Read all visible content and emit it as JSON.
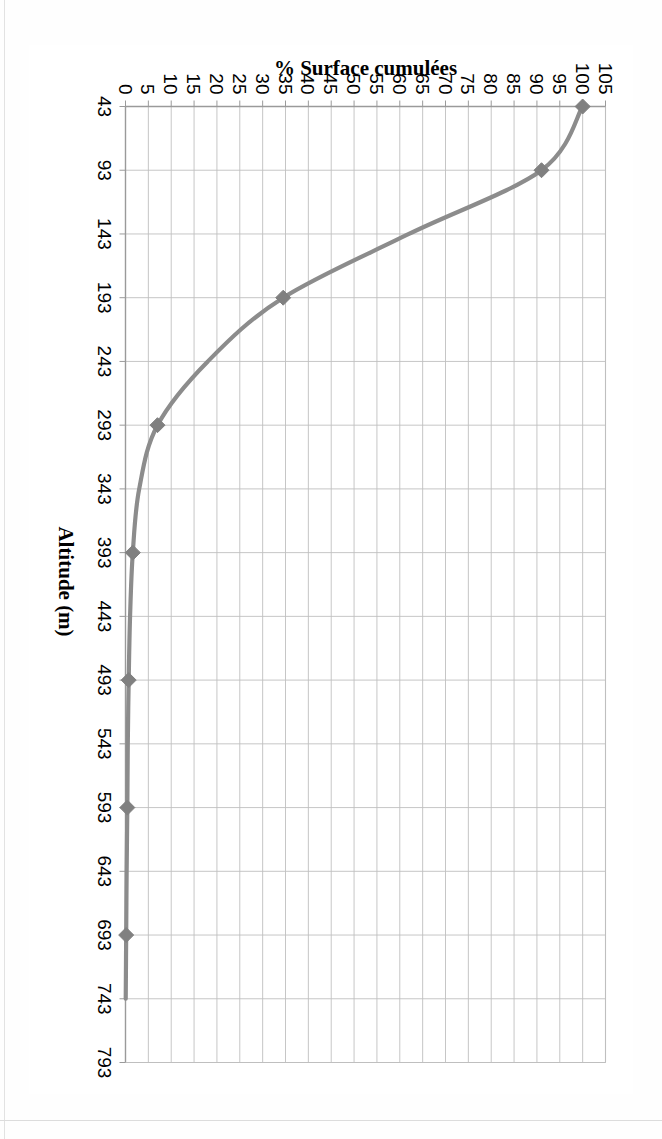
{
  "figure": {
    "orientation_note": "rotated",
    "line_color": "#8c8c8c",
    "marker_color": "#808080",
    "grid_color": "#bfbfbf",
    "axis_color": "#9a9a9a",
    "text_color": "#000000"
  },
  "chart_data": {
    "type": "line",
    "title": "",
    "xlabel": "Altitude (m)",
    "ylabel": "% Surface cumulées",
    "xlim": [
      43,
      793
    ],
    "ylim": [
      0,
      105
    ],
    "grid": true,
    "legend": false,
    "x_tick_labels": [
      "43",
      "93",
      "143",
      "193",
      "243",
      "293",
      "343",
      "393",
      "443",
      "493",
      "543",
      "593",
      "643",
      "693",
      "743",
      "793"
    ],
    "y_tick_labels": [
      "0",
      "5",
      "10",
      "15",
      "20",
      "25",
      "30",
      "35",
      "40",
      "45",
      "50",
      "55",
      "60",
      "65",
      "70",
      "75",
      "80",
      "85",
      "90",
      "95",
      "100",
      "105"
    ],
    "series": [
      {
        "name": "% Surface cumulées",
        "marker": "diamond",
        "x": [
          43,
          93,
          143,
          193,
          243,
          293,
          343,
          393,
          443,
          493,
          543,
          593,
          643,
          693,
          743
        ],
        "values": [
          100,
          91,
          62,
          34.5,
          18,
          7,
          3,
          1.6,
          1.0,
          0.7,
          0.5,
          0.4,
          0.25,
          0.15,
          0.05
        ],
        "marked_points": [
          {
            "x": 43,
            "y": 100
          },
          {
            "x": 93,
            "y": 91
          },
          {
            "x": 193,
            "y": 34.5
          },
          {
            "x": 293,
            "y": 7
          },
          {
            "x": 393,
            "y": 1.6
          },
          {
            "x": 493,
            "y": 0.7
          },
          {
            "x": 593,
            "y": 0.4
          },
          {
            "x": 693,
            "y": 0.15
          }
        ]
      }
    ]
  }
}
